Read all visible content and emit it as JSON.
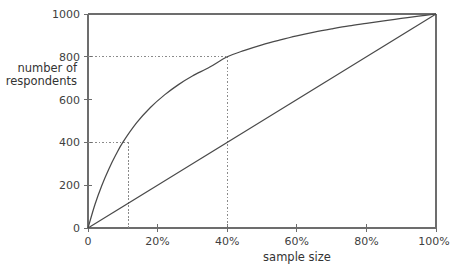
{
  "chart_data": {
    "type": "line",
    "title": "",
    "subtitle": "",
    "xlabel": "sample size",
    "ylabel": "number of respondents",
    "xlim": [
      0,
      100
    ],
    "ylim": [
      0,
      1000
    ],
    "grid": false,
    "legend_position": "none",
    "x_tick_labels": [
      "0",
      "20%",
      "40%",
      "60%",
      "80%",
      "100%"
    ],
    "x_tick_values": [
      0,
      20,
      40,
      60,
      80,
      100
    ],
    "y_tick_labels": [
      "0",
      "200",
      "400",
      "600",
      "800",
      "1000"
    ],
    "y_tick_values": [
      0,
      200,
      400,
      600,
      800,
      1000
    ],
    "series": [
      {
        "name": "diminishing returns curve",
        "style": "solid",
        "x": [
          0,
          2,
          4,
          6,
          8,
          10,
          14,
          18,
          22,
          26,
          30,
          35,
          40,
          45,
          50,
          55,
          60,
          65,
          70,
          75,
          80,
          85,
          90,
          95,
          100
        ],
        "values": [
          0,
          110,
          200,
          276,
          342,
          400,
          492,
          564,
          622,
          670,
          710,
          752,
          800,
          830,
          856,
          878,
          898,
          915,
          930,
          944,
          956,
          968,
          979,
          990,
          1000
        ]
      },
      {
        "name": "linear reference line",
        "style": "solid",
        "x": [
          0,
          100
        ],
        "values": [
          0,
          1000
        ]
      }
    ],
    "annotations": [
      {
        "name": "guide-10-percent",
        "x": 10,
        "y": 400,
        "label": "",
        "style": "dotted"
      },
      {
        "name": "guide-40-percent",
        "x": 40,
        "y": 800,
        "label": "",
        "style": "dotted"
      }
    ],
    "colors": {
      "curve": "#4a4a4a",
      "diagonal": "#4a4a4a",
      "axis": "#6d6d6d",
      "guide": "#8a8a8a",
      "text": "#3f3f3f",
      "background": "#ffffff"
    }
  },
  "axis": {
    "x_title": "sample size",
    "y_title_line1": "number of",
    "y_title_line2": "respondents",
    "x_ticks": [
      {
        "label": "0"
      },
      {
        "label": "20%"
      },
      {
        "label": "40%"
      },
      {
        "label": "60%"
      },
      {
        "label": "80%"
      },
      {
        "label": "100%"
      }
    ],
    "y_ticks": [
      {
        "label": "1000"
      },
      {
        "label": "800"
      },
      {
        "label": "600"
      },
      {
        "label": "400"
      },
      {
        "label": "200"
      },
      {
        "label": "0"
      }
    ]
  },
  "caption": {
    "text": ""
  }
}
